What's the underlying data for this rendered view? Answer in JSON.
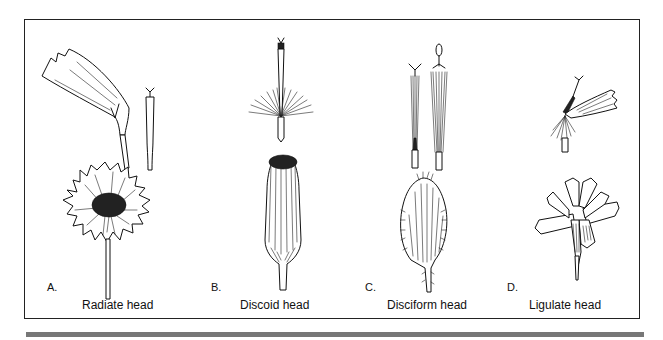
{
  "figure": {
    "panels": [
      {
        "letter": "A.",
        "caption": "Radiate head"
      },
      {
        "letter": "B.",
        "caption": "Discoid head"
      },
      {
        "letter": "C.",
        "caption": "Disciform head"
      },
      {
        "letter": "D.",
        "caption": "Ligulate head"
      }
    ]
  },
  "colors": {
    "line": "#111111",
    "background": "#ffffff",
    "bottom_bar": "#777777"
  }
}
